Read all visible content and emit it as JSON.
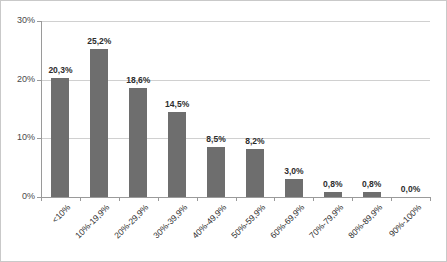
{
  "chart_data": {
    "type": "bar",
    "title": "",
    "xlabel": "",
    "ylabel": "",
    "categories": [
      "<10%",
      "10%-19,9%",
      "20%-29,9%",
      "30%-39,9%",
      "40%-49,9%",
      "50%-59,9%",
      "60%-69,9%",
      "70%-79,9%",
      "80%-89,9%",
      "90%-100%"
    ],
    "values": [
      20.3,
      25.2,
      18.6,
      14.5,
      8.5,
      8.2,
      3.0,
      0.8,
      0.8,
      0.0
    ],
    "data_labels": [
      "20,3%",
      "25,2%",
      "18,6%",
      "14,5%",
      "8,5%",
      "8,2%",
      "3,0%",
      "0,8%",
      "0,8%",
      "0,0%"
    ],
    "ylim": [
      0,
      30
    ],
    "yticks": [
      0,
      10,
      20,
      30
    ],
    "ytick_labels": [
      "0%",
      "10%",
      "20%",
      "30%"
    ],
    "grid": true,
    "legend": false,
    "series_color": "#6e6e6e",
    "gridline_color": "#d0d0d0",
    "axis_color": "#9a9a9a",
    "background": "#ffffff",
    "border_color": "#c9c9c9"
  }
}
